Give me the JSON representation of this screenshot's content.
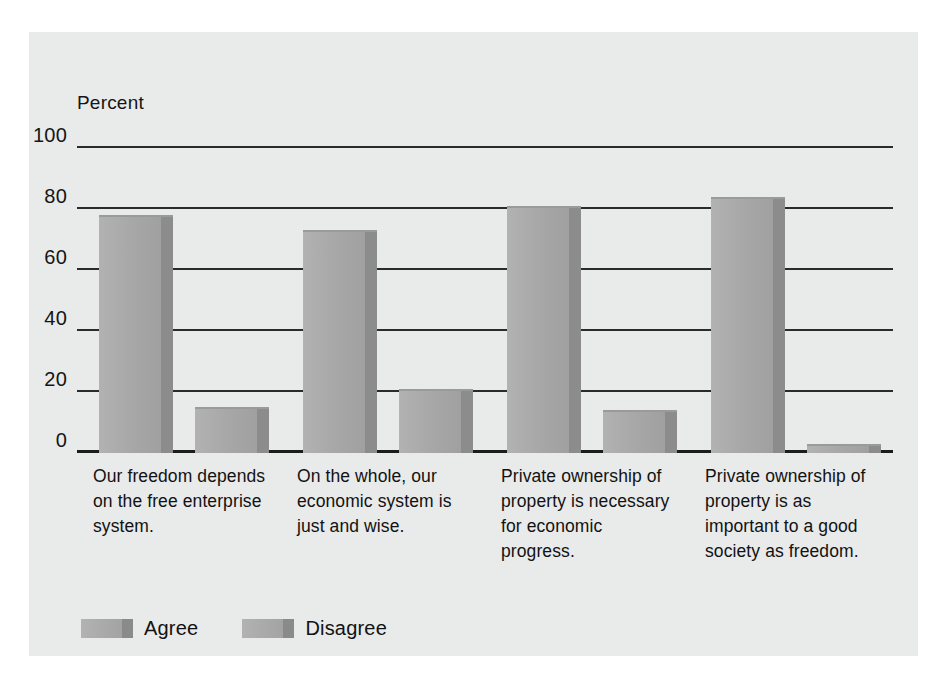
{
  "chart_data": {
    "type": "bar",
    "title": "",
    "xlabel": "",
    "ylabel": "Percent",
    "ylim": [
      0,
      100
    ],
    "yticks": [
      "0",
      "20",
      "40",
      "60",
      "80",
      "100"
    ],
    "ytick_values": [
      0,
      20,
      40,
      60,
      80,
      100
    ],
    "grid": true,
    "legend_position": "bottom-left",
    "categories": [
      "Our freedom depends on the free enterprise system.",
      "On the whole, our economic system is just and wise.",
      "Private ownership of property is necessary for economic progress.",
      "Private ownership of property is as important to a good society as freedom."
    ],
    "series": [
      {
        "name": "Agree",
        "values": [
          78,
          73,
          81,
          84
        ],
        "color": "#a8a8a8"
      },
      {
        "name": "Disagree",
        "values": [
          15,
          21,
          14,
          3
        ],
        "color": "#a8a8a8"
      }
    ]
  },
  "axis": {
    "y_title": "Percent"
  },
  "legend": {
    "items": [
      {
        "label": "Agree"
      },
      {
        "label": "Disagree"
      }
    ]
  },
  "colors": {
    "panel_background": "#e9eaea",
    "page_background": "#ffffff",
    "gridline": "#2a2a2a",
    "bar_face": "#a8a8a8",
    "bar_side": "#8c8c8c",
    "text": "#121212"
  }
}
